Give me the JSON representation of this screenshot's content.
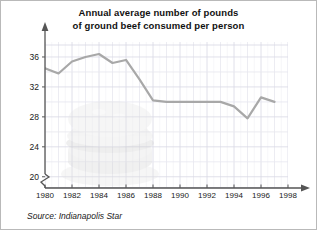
{
  "figure": {
    "title_line1": "Annual average number of pounds",
    "title_line2": "of ground beef consumed per person",
    "source": "Source: Indianapolis Star",
    "watermark_icon": "hamburger-icon"
  },
  "chart_data": {
    "type": "line",
    "title": "Annual average number of pounds of ground beef consumed per person",
    "xlabel": "",
    "ylabel": "",
    "x": [
      1980,
      1981,
      1982,
      1983,
      1984,
      1985,
      1986,
      1987,
      1988,
      1989,
      1990,
      1991,
      1992,
      1993,
      1994,
      1995,
      1996,
      1997
    ],
    "values": [
      34.5,
      33.8,
      35.4,
      36.0,
      36.4,
      35.2,
      35.6,
      33.0,
      30.2,
      30.0,
      30.0,
      30.0,
      30.0,
      30.0,
      29.4,
      27.8,
      30.6,
      30.0
    ],
    "xlim": [
      1980,
      1998
    ],
    "ylim": [
      18.5,
      38
    ],
    "xticks": [
      1980,
      1982,
      1984,
      1986,
      1988,
      1990,
      1992,
      1994,
      1996,
      1998
    ],
    "xtick_labels": [
      "1980",
      "1982",
      "1984",
      "1986",
      "1988",
      "1990",
      "1992",
      "1994",
      "1996",
      "1998"
    ],
    "yticks": [
      20,
      24,
      28,
      32,
      36
    ],
    "ytick_labels": [
      "20",
      "24",
      "28",
      "32",
      "36"
    ],
    "grid": true,
    "grid_minor": true,
    "legend": "none",
    "axis_break": true,
    "line_color": "#a8a8a8",
    "grid_color": "#d8d8e4"
  }
}
